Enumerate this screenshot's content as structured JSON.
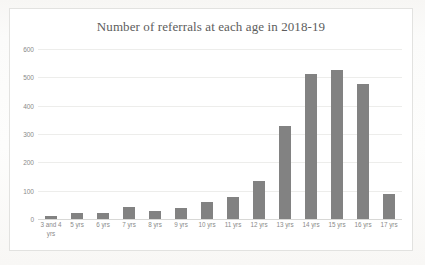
{
  "chart_data": {
    "type": "bar",
    "title": "Number of referrals at each age in 2018-19",
    "xlabel": "",
    "ylabel": "",
    "ylim": [
      0,
      600
    ],
    "yticks": [
      0,
      100,
      200,
      300,
      400,
      500,
      600
    ],
    "grid": true,
    "legend": false,
    "bar_color": "#828282",
    "categories": [
      "3 and 4 yrs",
      "5 yrs",
      "6 yrs",
      "7 yrs",
      "8 yrs",
      "9 yrs",
      "10 yrs",
      "11 yrs",
      "12 yrs",
      "13 yrs",
      "14 yrs",
      "15 yrs",
      "16 yrs",
      "17 yrs"
    ],
    "values": [
      12,
      22,
      20,
      42,
      27,
      40,
      60,
      77,
      135,
      328,
      512,
      527,
      477,
      88
    ]
  },
  "ytick_labels": [
    "600",
    "500",
    "400",
    "300",
    "200",
    "100",
    "0"
  ]
}
